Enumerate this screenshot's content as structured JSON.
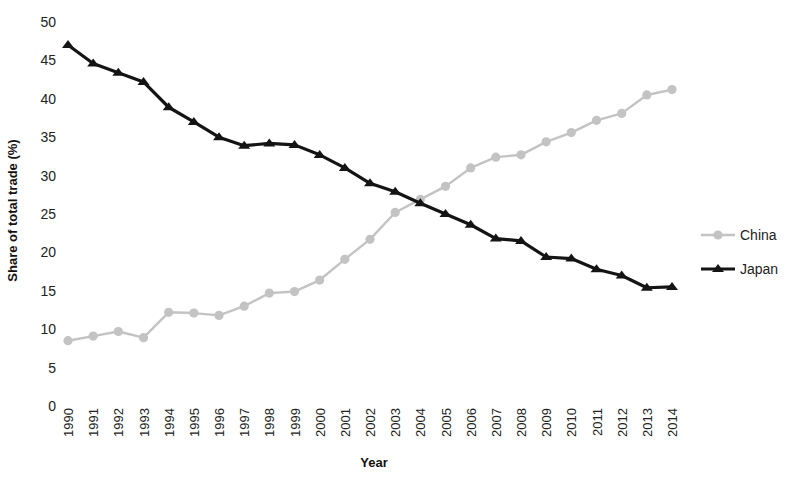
{
  "chart_data": {
    "type": "line",
    "title": "",
    "xlabel": "Year",
    "ylabel": "Share of total trade (%)",
    "categories": [
      "1990",
      "1991",
      "1992",
      "1993",
      "1994",
      "1995",
      "1996",
      "1997",
      "1998",
      "1999",
      "2000",
      "2001",
      "2002",
      "2003",
      "2004",
      "2005",
      "2006",
      "2007",
      "2008",
      "2009",
      "2010",
      "2011",
      "2012",
      "2013",
      "2014"
    ],
    "x": [
      1990,
      1991,
      1992,
      1993,
      1994,
      1995,
      1996,
      1997,
      1998,
      1999,
      2000,
      2001,
      2002,
      2003,
      2004,
      2005,
      2006,
      2007,
      2008,
      2009,
      2010,
      2011,
      2012,
      2013,
      2014
    ],
    "ylim": [
      0,
      50
    ],
    "yticks": [
      0,
      5,
      10,
      15,
      20,
      25,
      30,
      35,
      40,
      45,
      50
    ],
    "grid": false,
    "legend_position": "right",
    "series": [
      {
        "name": "China",
        "color": "#c3c3c3",
        "marker": "circle",
        "values": [
          8.5,
          9.1,
          9.7,
          8.9,
          12.2,
          12.1,
          11.8,
          13.0,
          14.7,
          14.9,
          16.4,
          19.1,
          21.7,
          25.2,
          26.9,
          28.6,
          31.0,
          32.4,
          32.7,
          34.4,
          35.6,
          37.2,
          38.1,
          40.5,
          41.2
        ]
      },
      {
        "name": "Japan",
        "color": "#141414",
        "marker": "triangle",
        "values": [
          47.0,
          44.6,
          43.4,
          42.2,
          38.9,
          37.0,
          35.0,
          33.9,
          34.2,
          34.0,
          32.7,
          31.0,
          29.0,
          27.9,
          26.4,
          25.0,
          23.6,
          21.8,
          21.5,
          19.4,
          19.2,
          17.8,
          17.0,
          15.4,
          15.5
        ]
      }
    ]
  },
  "legend": {
    "items": [
      {
        "label": "China"
      },
      {
        "label": "Japan"
      }
    ]
  },
  "axes": {
    "y_title": "Share of total trade (%)",
    "x_title": "Year"
  }
}
